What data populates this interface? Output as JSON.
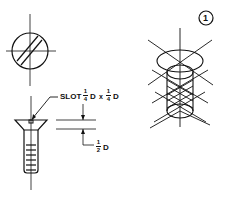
{
  "figure": {
    "number": "1",
    "views": [
      "top-view",
      "side-view",
      "isometric-view"
    ]
  },
  "annotations": {
    "slot_label": "SLOT",
    "slot_width": {
      "numerator": "1",
      "denominator": "4",
      "unit": "D"
    },
    "times": "x",
    "slot_depth": {
      "numerator": "1",
      "denominator": "4",
      "unit": "D"
    },
    "head_height": {
      "numerator": "1",
      "denominator": "2",
      "unit": "D"
    }
  },
  "colors": {
    "line": "#111111",
    "background": "#ffffff"
  }
}
